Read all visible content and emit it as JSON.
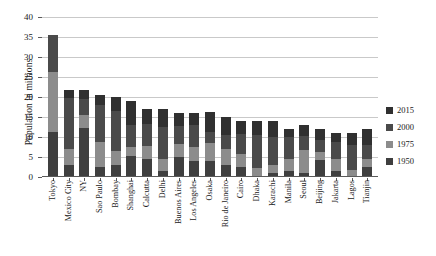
{
  "chart_data": {
    "type": "bar",
    "title": "",
    "subtitle": "",
    "xlabel": "",
    "ylabel": "Population in millions",
    "ylim": [
      0,
      40
    ],
    "ytick_step": 5,
    "yticks": [
      40,
      35,
      30,
      25,
      20,
      15,
      10,
      5,
      0
    ],
    "grid": "horizontal",
    "stacked": true,
    "legend_position": "right",
    "legend_order_top_to_bottom": [
      "2015",
      "2000",
      "1975",
      "1950"
    ],
    "categories": [
      "Tokyo",
      "Mexico City",
      "NY",
      "Sao Paulo",
      "Bombay",
      "Shanghai",
      "Calcutta",
      "Delhi",
      "Buenos Aires",
      "Los Angeles",
      "Osaka",
      "Rio de Janeiro",
      "Cairo",
      "Dhaka",
      "Karachi",
      "Manila",
      "Seoul",
      "Beijing",
      "Jakarta",
      "Lagos",
      "Tianjin"
    ],
    "series": [
      {
        "name": "1950",
        "color": "#3f3f3f",
        "values": [
          11.3,
          3.1,
          12.3,
          2.4,
          2.9,
          5.3,
          4.5,
          1.4,
          5.1,
          4.0,
          4.1,
          2.9,
          2.4,
          0.3,
          1.0,
          1.5,
          1.0,
          4.3,
          1.5,
          0.3,
          2.4
        ]
      },
      {
        "name": "1975",
        "color": "#8c8c8c",
        "values": [
          14.9,
          4.0,
          3.1,
          6.4,
          3.6,
          2.2,
          3.3,
          3.1,
          3.1,
          3.6,
          4.5,
          4.2,
          3.3,
          1.9,
          2.0,
          3.0,
          5.8,
          2.0,
          3.0,
          1.5,
          2.1
        ]
      },
      {
        "name": "2000",
        "color": "#4a4a4a",
        "values": [
          9.3,
          12.7,
          4.2,
          9.3,
          10.1,
          5.5,
          5.4,
          8.0,
          4.5,
          5.3,
          2.6,
          3.5,
          5.1,
          8.3,
          7.1,
          5.5,
          3.4,
          3.0,
          4.2,
          6.2,
          3.6
        ]
      },
      {
        "name": "2015",
        "color": "#303030",
        "values": [
          0.0,
          2.0,
          2.1,
          2.4,
          3.4,
          6.0,
          3.8,
          4.5,
          3.3,
          3.1,
          5.0,
          4.4,
          3.2,
          3.5,
          3.9,
          2.0,
          2.8,
          2.7,
          2.3,
          3.0,
          3.9
        ]
      }
    ]
  }
}
